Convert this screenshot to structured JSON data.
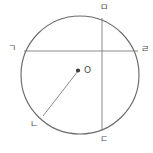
{
  "figure": {
    "type": "circle-with-chords-diagram",
    "background_color": "#ffffff",
    "stroke_color": "#6b6b6b",
    "label_color": "#4a4a4a",
    "circle": {
      "center_x": 80,
      "center_y": 75,
      "radius": 59,
      "center_point_label": "O",
      "center_dot_radius": 2.1
    },
    "chords": [
      {
        "name": "horizontal-chord",
        "from_label": "ㄱ",
        "to_label": "ㄹ",
        "x1": 24,
        "y1": 51,
        "x2": 138,
        "y2": 51
      },
      {
        "name": "vertical-chord",
        "from_label": "ㅁ",
        "to_label": "ㄷ",
        "x1": 102,
        "y1": 18,
        "x2": 102,
        "y2": 131
      }
    ],
    "radius_segment": {
      "name": "radius-to-nieun",
      "from_label": "O",
      "to_label": "ㄴ",
      "x1": 78,
      "y1": 71,
      "x2": 43,
      "y2": 116
    },
    "labels": [
      {
        "id": "label-giyeok",
        "text": "ㄱ",
        "x": 8,
        "y": 44
      },
      {
        "id": "label-rieul",
        "text": "ㄹ",
        "x": 141,
        "y": 45
      },
      {
        "id": "label-mieum",
        "text": "ㅁ",
        "x": 100,
        "y": 3
      },
      {
        "id": "label-digeut",
        "text": "ㄷ",
        "x": 100,
        "y": 135
      },
      {
        "id": "label-nieun",
        "text": "ㄴ",
        "x": 30,
        "y": 120
      },
      {
        "id": "label-center-o",
        "text": "O",
        "x": 84,
        "y": 66
      }
    ]
  }
}
